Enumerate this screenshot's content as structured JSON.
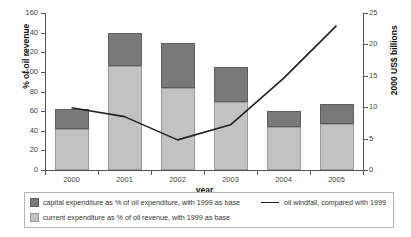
{
  "chart_data": {
    "type": "bar",
    "title": "",
    "subtitle": "",
    "xlabel": "year",
    "ylabel": "% of oil revenue",
    "y2label": "2000 US$ billions",
    "categories": [
      "2000",
      "2001",
      "2002",
      "2003",
      "2004",
      "2005"
    ],
    "ylim": [
      0,
      160
    ],
    "y2lim": [
      0,
      25
    ],
    "yticks": [
      "0",
      "20",
      "40",
      "60",
      "80",
      "100",
      "120",
      "140",
      "160"
    ],
    "y2ticks": [
      "0",
      "5",
      "10",
      "15",
      "20",
      "25"
    ],
    "grid": false,
    "legend_position": "below-plot",
    "stacked": true,
    "series": [
      {
        "name": "current expenditure as % of oil revenue, with 1999 as base",
        "type": "bar",
        "axis": "left",
        "color": "#c2c2c2",
        "values": [
          42,
          106,
          84,
          69,
          44,
          47
        ]
      },
      {
        "name": "capital expenditure as % of oil expenditure, with 1999 as base",
        "type": "bar",
        "axis": "left",
        "color": "#797979",
        "values": [
          20,
          34,
          45,
          36,
          16,
          20
        ]
      },
      {
        "name": "oil windfall, compared with 1999",
        "type": "line",
        "axis": "right",
        "color": "#222222",
        "values": [
          9.9,
          8.5,
          4.8,
          7.2,
          14.6,
          23.0
        ]
      }
    ],
    "bar_totals": [
      62,
      140,
      129,
      105,
      60,
      67
    ]
  },
  "legend": {
    "items": [
      {
        "marker": "square-dark",
        "label": "capital expenditure as % of oil expenditure, with 1999 as base"
      },
      {
        "marker": "square-light",
        "label": "current expenditure as % of oil revenue, with 1999 as base"
      },
      {
        "marker": "line-black",
        "label": "oil windfall, compared with 1999"
      }
    ]
  }
}
